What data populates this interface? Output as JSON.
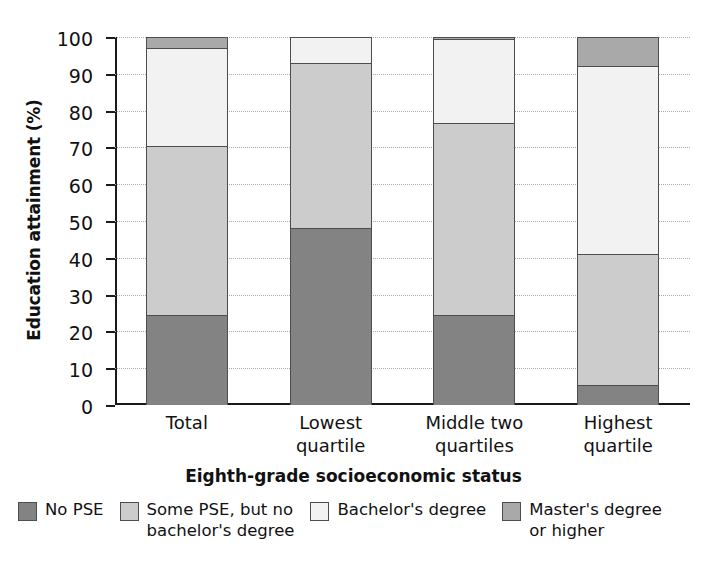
{
  "chart_data": {
    "type": "bar",
    "subtype": "stacked-bar-100",
    "title": "",
    "xlabel": "Eighth-grade socioeconomic status",
    "ylabel": "Education attainment (%)",
    "ylim": [
      0,
      100
    ],
    "ytick_values": [
      0,
      10,
      20,
      30,
      40,
      50,
      60,
      70,
      80,
      90,
      100
    ],
    "ytick_labels": [
      "0",
      "10",
      "20",
      "30",
      "40",
      "50",
      "60",
      "70",
      "80",
      "90",
      "100"
    ],
    "grid": true,
    "grid_axis": "y",
    "legend_position": "bottom",
    "categories": [
      "Total",
      "Lowest quartile",
      "Middle two quartiles",
      "Highest quartile"
    ],
    "category_lines": [
      [
        "Total"
      ],
      [
        "Lowest",
        "quartile"
      ],
      [
        "Middle two",
        "quartiles"
      ],
      [
        "Highest",
        "quartile"
      ]
    ],
    "series": [
      {
        "name": "No PSE",
        "color": "#838383",
        "values": [
          24.5,
          48.0,
          24.5,
          5.5
        ]
      },
      {
        "name": "Some PSE, but no bachelor's degree",
        "name_lines": [
          "Some PSE, but no",
          "bachelor's degree"
        ],
        "color": "#cccccc",
        "values": [
          46.0,
          45.0,
          52.0,
          35.5
        ]
      },
      {
        "name": "Bachelor's degree",
        "name_lines": [
          "Bachelor's degree"
        ],
        "color": "#f2f2f2",
        "values": [
          26.5,
          7.0,
          23.0,
          51.0
        ]
      },
      {
        "name": "Master's degree or higher",
        "name_lines": [
          "Master's degree",
          "or higher"
        ],
        "color": "#a9a9a9",
        "values": [
          3.0,
          0.0,
          0.5,
          8.0
        ]
      }
    ],
    "cumulative_tops": [
      [
        24.5,
        70.5,
        97.0,
        100.0
      ],
      [
        48.0,
        93.0,
        100.0,
        100.0
      ],
      [
        24.5,
        76.5,
        99.5,
        100.0
      ],
      [
        5.5,
        41.0,
        92.0,
        100.0
      ]
    ]
  },
  "legend": [
    {
      "label": "No PSE",
      "color": "#838383"
    },
    {
      "label": "Some PSE, but no\nbachelor's degree",
      "color": "#cccccc"
    },
    {
      "label": "Bachelor's degree",
      "color": "#f2f2f2"
    },
    {
      "label": "Master's degree\nor higher",
      "color": "#a9a9a9"
    }
  ]
}
